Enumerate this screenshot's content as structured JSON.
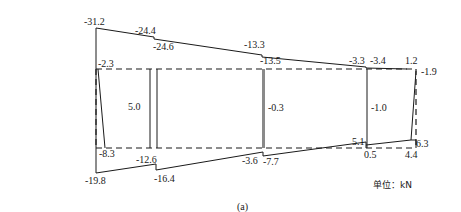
{
  "diagram": {
    "type": "internal force diagram (shear/axial force)",
    "caption": "(a)",
    "unit_label": "单位：kN",
    "colors": {
      "line": "#1a1a1a",
      "gray_bar": "#8a8a8a",
      "background": "#ffffff"
    },
    "top_chord_labels": [
      "-31.2",
      "-24.4",
      "-24.6",
      "-13.3",
      "-13.5",
      "-3.3",
      "-3.4",
      "1.2",
      "-1.9"
    ],
    "upper_chord_labels": [
      "-2.3"
    ],
    "web_labels": [
      "5.0",
      "-0.3",
      "-1.0"
    ],
    "lower_chord_labels": [
      "-8.3",
      "-12.6",
      "-3.6",
      "-7.7",
      "5.1",
      "0.5",
      "4.4",
      "6.3"
    ],
    "bottom_chord_labels": [
      "-19.8",
      "-16.4"
    ],
    "labels": {
      "l1": "-31.2",
      "l2": "-24.4",
      "l3": "-24.6",
      "l4": "-13.3",
      "l5": "-13.5",
      "l6": "-3.3",
      "l7": "-3.4",
      "l8": "1.2",
      "l9": "-1.9",
      "l10": "-2.3",
      "l11": "5.0",
      "l12": "-0.3",
      "l13": "-1.0",
      "l14": "-8.3",
      "l15": "-12.6",
      "l16": "-3.6",
      "l17": "-7.7",
      "l18": "5.1",
      "l19": "0.5",
      "l20": "4.4",
      "l21": "6.3",
      "l22": "-19.8",
      "l23": "-16.4"
    }
  }
}
